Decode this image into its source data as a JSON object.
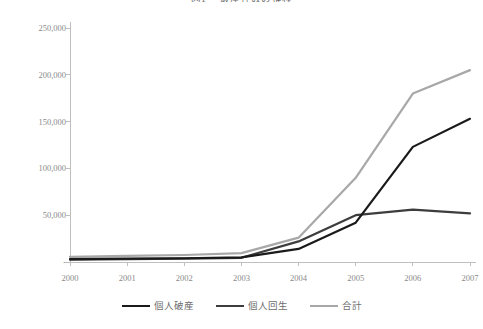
{
  "chart_data": {
    "type": "line",
    "title_number": "図1",
    "title_text": "破産件数の推移",
    "xlabel": "",
    "ylabel": "",
    "x": [
      2000,
      2001,
      2002,
      2003,
      2004,
      2005,
      2006,
      2007
    ],
    "categories": [
      "2000",
      "2001",
      "2002",
      "2003",
      "2004",
      "2005",
      "2006",
      "2007"
    ],
    "xtick_labels": [
      "2000",
      "2001",
      "2002",
      "2003",
      "2004",
      "2005",
      "2006",
      "2007"
    ],
    "ytick_labels": [
      "-",
      "50,000",
      "100,000",
      "150,000",
      "200,000",
      "250,000"
    ],
    "ytick_values": [
      0,
      50000,
      100000,
      150000,
      200000,
      250000
    ],
    "ylim": [
      0,
      250000
    ],
    "grid": false,
    "legend_position": "bottom",
    "series": [
      {
        "name": "個人破産",
        "color": "#1a1a1a",
        "width": 2.2,
        "values": [
          3000,
          3500,
          4000,
          5000,
          14000,
          42000,
          123000,
          153000
        ]
      },
      {
        "name": "個人回生",
        "color": "#3d3d3d",
        "width": 2.2,
        "values": [
          2500,
          3000,
          3500,
          4500,
          22000,
          50000,
          56000,
          52000
        ]
      },
      {
        "name": "合計",
        "color": "#a8a8a8",
        "width": 2.2,
        "values": [
          5500,
          6500,
          7500,
          9500,
          26000,
          90000,
          180000,
          205000
        ]
      }
    ]
  },
  "axes": {
    "y_tick_zero_dash": "-"
  },
  "legend": {
    "items": [
      {
        "label": "個人破産",
        "color": "#1a1a1a",
        "width": "2.2px"
      },
      {
        "label": "個人回生",
        "color": "#3d3d3d",
        "width": "2.2px"
      },
      {
        "label": "合計",
        "color": "#a8a8a8",
        "width": "2.2px"
      }
    ]
  },
  "colors": {
    "axis": "#bfbfbf",
    "tick_text": "#8a8a8a",
    "title_text": "#6e6e6e",
    "background": "#ffffff"
  }
}
